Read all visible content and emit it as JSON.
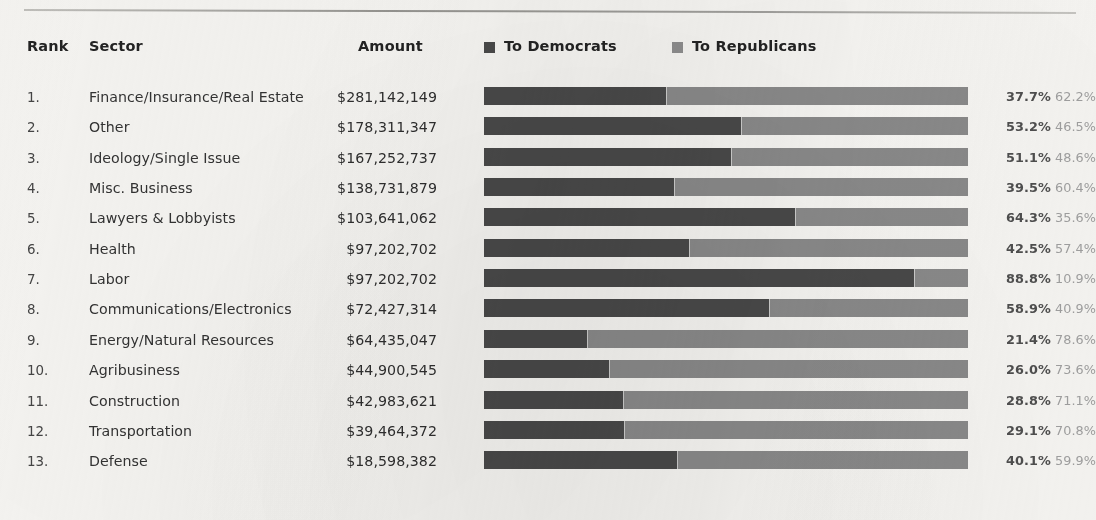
{
  "table": {
    "columns": {
      "rank": "Rank",
      "sector": "Sector",
      "amount": "Amount"
    }
  },
  "legend": {
    "democrats": {
      "label": "To Democrats",
      "color": "#4a4a4a",
      "swatch_icon": "square-swatch-icon"
    },
    "republicans": {
      "label": "To Republicans",
      "color": "#8e8e8e",
      "swatch_icon": "square-swatch-icon"
    }
  },
  "colors": {
    "background": "#f7f6f3",
    "democrat_bar": "#494949",
    "republican_bar": "#8a8a8a",
    "text": "#3a3a3a",
    "pct_dem_text": "#4f4f4f",
    "pct_rep_text": "#a0a0a0",
    "rule": "#8e8d89"
  },
  "chart_data": {
    "type": "bar",
    "title": "",
    "subtitle": "",
    "xlabel": "",
    "ylabel": "",
    "orientation": "horizontal",
    "stacked": true,
    "normalized": true,
    "grid": false,
    "legend_position": "top",
    "xlim": [
      0,
      100
    ],
    "categories": [
      "Finance/Insurance/Real Estate",
      "Other",
      "Ideology/Single Issue",
      "Misc. Business",
      "Lawyers & Lobbyists",
      "Health",
      "Labor",
      "Communications/Electronics",
      "Energy/Natural Resources",
      "Agribusiness",
      "Construction",
      "Transportation",
      "Defense"
    ],
    "series": [
      {
        "name": "To Democrats",
        "color": "#494949",
        "values": [
          37.7,
          53.2,
          51.1,
          39.5,
          64.3,
          42.5,
          88.8,
          58.9,
          21.4,
          26.0,
          28.8,
          29.1,
          40.1
        ]
      },
      {
        "name": "To Republicans",
        "color": "#8a8a8a",
        "values": [
          62.2,
          46.5,
          48.6,
          60.4,
          35.6,
          57.4,
          10.9,
          40.9,
          78.6,
          73.6,
          71.1,
          70.8,
          59.9
        ]
      }
    ],
    "amounts": [
      281142149,
      178311347,
      167252737,
      138731879,
      103641062,
      97202702,
      97202702,
      72427314,
      64435047,
      44900545,
      42983621,
      39464372,
      18598382
    ]
  },
  "rows": [
    {
      "rank": "1.",
      "sector": "Finance/Insurance/Real Estate",
      "amount": "$281,142,149",
      "dem_pct": "37.7%",
      "rep_pct": "62.2%",
      "dem_value": 37.7,
      "rep_value": 62.2
    },
    {
      "rank": "2.",
      "sector": "Other",
      "amount": "$178,311,347",
      "dem_pct": "53.2%",
      "rep_pct": "46.5%",
      "dem_value": 53.2,
      "rep_value": 46.5
    },
    {
      "rank": "3.",
      "sector": "Ideology/Single Issue",
      "amount": "$167,252,737",
      "dem_pct": "51.1%",
      "rep_pct": "48.6%",
      "dem_value": 51.1,
      "rep_value": 48.6
    },
    {
      "rank": "4.",
      "sector": "Misc. Business",
      "amount": "$138,731,879",
      "dem_pct": "39.5%",
      "rep_pct": "60.4%",
      "dem_value": 39.5,
      "rep_value": 60.4
    },
    {
      "rank": "5.",
      "sector": "Lawyers & Lobbyists",
      "amount": "$103,641,062",
      "dem_pct": "64.3%",
      "rep_pct": "35.6%",
      "dem_value": 64.3,
      "rep_value": 35.6
    },
    {
      "rank": "6.",
      "sector": "Health",
      "amount": "$97,202,702",
      "dem_pct": "42.5%",
      "rep_pct": "57.4%",
      "dem_value": 42.5,
      "rep_value": 57.4
    },
    {
      "rank": "7.",
      "sector": "Labor",
      "amount": "$97,202,702",
      "dem_pct": "88.8%",
      "rep_pct": "10.9%",
      "dem_value": 88.8,
      "rep_value": 10.9
    },
    {
      "rank": "8.",
      "sector": "Communications/Electronics",
      "amount": "$72,427,314",
      "dem_pct": "58.9%",
      "rep_pct": "40.9%",
      "dem_value": 58.9,
      "rep_value": 40.9
    },
    {
      "rank": "9.",
      "sector": "Energy/Natural Resources",
      "amount": "$64,435,047",
      "dem_pct": "21.4%",
      "rep_pct": "78.6%",
      "dem_value": 21.4,
      "rep_value": 78.6
    },
    {
      "rank": "10.",
      "sector": "Agribusiness",
      "amount": "$44,900,545",
      "dem_pct": "26.0%",
      "rep_pct": "73.6%",
      "dem_value": 26.0,
      "rep_value": 73.6
    },
    {
      "rank": "11.",
      "sector": "Construction",
      "amount": "$42,983,621",
      "dem_pct": "28.8%",
      "rep_pct": "71.1%",
      "dem_value": 28.8,
      "rep_value": 71.1
    },
    {
      "rank": "12.",
      "sector": "Transportation",
      "amount": "$39,464,372",
      "dem_pct": "29.1%",
      "rep_pct": "70.8%",
      "dem_value": 29.1,
      "rep_value": 70.8
    },
    {
      "rank": "13.",
      "sector": "Defense",
      "amount": "$18,598,382",
      "dem_pct": "40.1%",
      "rep_pct": "59.9%",
      "dem_value": 40.1,
      "rep_value": 59.9
    }
  ]
}
